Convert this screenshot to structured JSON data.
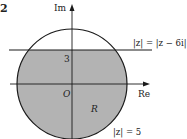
{
  "figure": {
    "question_number": "2",
    "axes": {
      "x_label": "Re",
      "y_label": "Im",
      "origin_label": "O"
    },
    "tick_labels": {
      "y_tick": "3"
    },
    "curves": {
      "line_label": "|z| = |z − 6i|",
      "circle_label": "|z| = 5"
    },
    "region_label": "R",
    "colors": {
      "shade": "#b3b3b3",
      "stroke": "#1a1a1a",
      "background": "#ffffff"
    }
  }
}
